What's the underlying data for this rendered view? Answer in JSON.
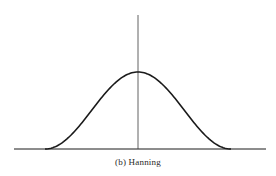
{
  "figure": {
    "caption": "(b)  Hanning",
    "window_name": "Hanning",
    "panel_label": "(b)",
    "line_color": "#1a1a1a",
    "background": "#ffffff"
  },
  "chart_data": {
    "type": "line",
    "title": "(b) Hanning",
    "xlabel": "",
    "ylabel": "",
    "axes": {
      "horizontal_baseline": true,
      "vertical_center_axis": true,
      "ticks": false,
      "grid": false
    },
    "x": [
      -1.0,
      -0.75,
      -0.5,
      -0.25,
      0.0,
      0.25,
      0.5,
      0.75,
      1.0
    ],
    "series": [
      {
        "name": "Hanning",
        "values": [
          0.0,
          0.146,
          0.5,
          0.854,
          1.0,
          0.854,
          0.5,
          0.146,
          0.0
        ]
      }
    ],
    "ylim": [
      0,
      1.0
    ]
  }
}
